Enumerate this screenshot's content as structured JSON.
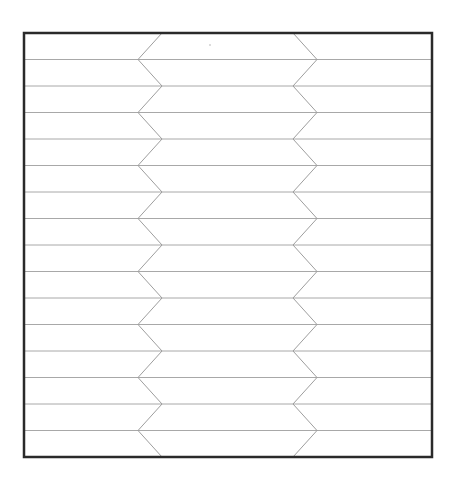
{
  "diagram": {
    "type": "zigzag-striped-box",
    "canvas": {
      "width": 455,
      "height": 483
    },
    "frame": {
      "x": 24,
      "y": 33,
      "width": 408,
      "height": 424,
      "stroke": "#2a2a2a",
      "stroke_width": 2.5
    },
    "rows": 16,
    "line_color": "#a8a8a8",
    "line_width": 1,
    "zigzag": {
      "left_inner_x": 162,
      "left_outer_x": 138,
      "right_inner_x": 293,
      "right_outer_x": 317,
      "color": "#9e9e9e"
    },
    "speck": {
      "x": 210,
      "y": 45,
      "r": 0.8,
      "color": "#b0b0b0"
    }
  }
}
